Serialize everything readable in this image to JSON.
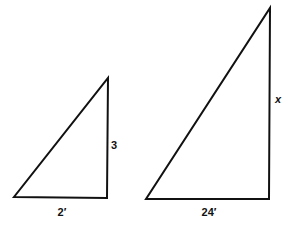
{
  "figure": {
    "type": "geometry-diagram",
    "background_color": "#ffffff",
    "stroke_color": "#111111",
    "stroke_width": 2,
    "width": 291,
    "height": 231
  },
  "shapes": {
    "small_triangle": {
      "name": "small-right-triangle",
      "points": "14,197 107,198 108,78",
      "vertices": {
        "bottom_left": [
          14,
          197
        ],
        "bottom_right": [
          107,
          198
        ],
        "apex": [
          108,
          78
        ]
      },
      "labels": {
        "vertical_leg": "3",
        "base": "2′"
      }
    },
    "large_triangle": {
      "name": "large-right-triangle",
      "points": "146,199 269,199 270,8",
      "vertices": {
        "bottom_left": [
          146,
          199
        ],
        "bottom_right": [
          269,
          199
        ],
        "apex": [
          270,
          8
        ]
      },
      "labels": {
        "vertical_leg": "x",
        "base": "24′"
      }
    }
  },
  "annotations": {
    "small_height_label": {
      "text": "3",
      "x": 114,
      "y": 145
    },
    "small_base_label": {
      "text": "2′",
      "x": 62,
      "y": 212
    },
    "large_height_label": {
      "text": "x",
      "x": 278,
      "y": 99
    },
    "large_base_label": {
      "text": "24′",
      "x": 209,
      "y": 212
    }
  }
}
